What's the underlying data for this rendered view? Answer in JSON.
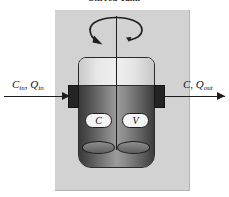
{
  "figure": {
    "title": "Stirred Tank",
    "background_color": "#ffffff",
    "panel_color": "#d2d2d2",
    "ink_color": "#1c1c1c"
  },
  "flows": {
    "inlet": {
      "concentration_symbol": "C",
      "concentration_subscript": "in",
      "flowrate_symbol": "Q",
      "flowrate_subscript": "in",
      "separator": ", ",
      "arrow": "arrow-right"
    },
    "outlet": {
      "concentration_symbol": "C",
      "concentration_subscript": "",
      "flowrate_symbol": "Q",
      "flowrate_subscript": "out",
      "separator": ", ",
      "arrow": "arrow-right"
    }
  },
  "vessel": {
    "concentration_tag": "C",
    "volume_tag": "V",
    "liquid_color": "#6c6c6c",
    "headspace_color": "#e2e2e2",
    "outline_color": "#2b2b2b"
  },
  "agitator": {
    "rotation_icon": "curved-rotation-arrow",
    "shaft_icon": "vertical-shaft",
    "blade_count": 2
  }
}
